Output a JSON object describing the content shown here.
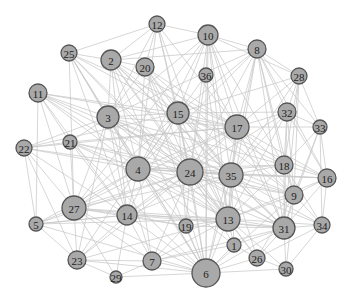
{
  "graph": {
    "title": "",
    "node_fill": "#a9a9a9",
    "node_stroke": "#555555",
    "edge_color": "#c8c8c8",
    "nodes": [
      {
        "id": "12",
        "x": 157,
        "y": 24,
        "size": 8
      },
      {
        "id": "25",
        "x": 69,
        "y": 53,
        "size": 8
      },
      {
        "id": "2",
        "x": 111,
        "y": 60,
        "size": 10
      },
      {
        "id": "20",
        "x": 145,
        "y": 67,
        "size": 9
      },
      {
        "id": "10",
        "x": 208,
        "y": 35,
        "size": 10
      },
      {
        "id": "8",
        "x": 257,
        "y": 49,
        "size": 9
      },
      {
        "id": "36",
        "x": 206,
        "y": 75,
        "size": 7
      },
      {
        "id": "28",
        "x": 299,
        "y": 76,
        "size": 8
      },
      {
        "id": "11",
        "x": 38,
        "y": 93,
        "size": 9
      },
      {
        "id": "3",
        "x": 108,
        "y": 117,
        "size": 11
      },
      {
        "id": "15",
        "x": 178,
        "y": 113,
        "size": 11
      },
      {
        "id": "17",
        "x": 237,
        "y": 127,
        "size": 12
      },
      {
        "id": "32",
        "x": 287,
        "y": 112,
        "size": 9
      },
      {
        "id": "33",
        "x": 320,
        "y": 127,
        "size": 7
      },
      {
        "id": "22",
        "x": 24,
        "y": 148,
        "size": 8
      },
      {
        "id": "21",
        "x": 70,
        "y": 142,
        "size": 7
      },
      {
        "id": "4",
        "x": 138,
        "y": 169,
        "size": 12
      },
      {
        "id": "24",
        "x": 190,
        "y": 172,
        "size": 13
      },
      {
        "id": "35",
        "x": 231,
        "y": 175,
        "size": 12
      },
      {
        "id": "18",
        "x": 284,
        "y": 165,
        "size": 9
      },
      {
        "id": "16",
        "x": 327,
        "y": 178,
        "size": 9
      },
      {
        "id": "9",
        "x": 294,
        "y": 195,
        "size": 9
      },
      {
        "id": "27",
        "x": 74,
        "y": 208,
        "size": 12
      },
      {
        "id": "14",
        "x": 127,
        "y": 215,
        "size": 10
      },
      {
        "id": "5",
        "x": 36,
        "y": 224,
        "size": 7
      },
      {
        "id": "13",
        "x": 228,
        "y": 219,
        "size": 12
      },
      {
        "id": "19",
        "x": 186,
        "y": 226,
        "size": 7
      },
      {
        "id": "31",
        "x": 284,
        "y": 228,
        "size": 11
      },
      {
        "id": "34",
        "x": 322,
        "y": 225,
        "size": 8
      },
      {
        "id": "1",
        "x": 234,
        "y": 245,
        "size": 7
      },
      {
        "id": "23",
        "x": 77,
        "y": 260,
        "size": 9
      },
      {
        "id": "7",
        "x": 152,
        "y": 261,
        "size": 9
      },
      {
        "id": "26",
        "x": 257,
        "y": 258,
        "size": 8
      },
      {
        "id": "29",
        "x": 116,
        "y": 277,
        "size": 6
      },
      {
        "id": "30",
        "x": 286,
        "y": 269,
        "size": 7
      },
      {
        "id": "6",
        "x": 206,
        "y": 273,
        "size": 14
      }
    ],
    "edges": [
      [
        "12",
        "2"
      ],
      [
        "12",
        "20"
      ],
      [
        "12",
        "15"
      ],
      [
        "12",
        "3"
      ],
      [
        "12",
        "17"
      ],
      [
        "12",
        "24"
      ],
      [
        "12",
        "4"
      ],
      [
        "12",
        "10"
      ],
      [
        "12",
        "25"
      ],
      [
        "12",
        "13"
      ],
      [
        "25",
        "2"
      ],
      [
        "25",
        "3"
      ],
      [
        "25",
        "15"
      ],
      [
        "25",
        "4"
      ],
      [
        "25",
        "24"
      ],
      [
        "25",
        "17"
      ],
      [
        "25",
        "27"
      ],
      [
        "25",
        "14"
      ],
      [
        "25",
        "13"
      ],
      [
        "25",
        "6"
      ],
      [
        "2",
        "20"
      ],
      [
        "2",
        "3"
      ],
      [
        "2",
        "15"
      ],
      [
        "2",
        "4"
      ],
      [
        "2",
        "24"
      ],
      [
        "2",
        "17"
      ],
      [
        "2",
        "35"
      ],
      [
        "2",
        "13"
      ],
      [
        "2",
        "6"
      ],
      [
        "2",
        "8"
      ],
      [
        "2",
        "10"
      ],
      [
        "2",
        "31"
      ],
      [
        "2",
        "14"
      ],
      [
        "20",
        "15"
      ],
      [
        "20",
        "3"
      ],
      [
        "20",
        "24"
      ],
      [
        "20",
        "4"
      ],
      [
        "20",
        "17"
      ],
      [
        "20",
        "13"
      ],
      [
        "20",
        "35"
      ],
      [
        "20",
        "6"
      ],
      [
        "20",
        "9"
      ],
      [
        "10",
        "8"
      ],
      [
        "10",
        "15"
      ],
      [
        "10",
        "17"
      ],
      [
        "10",
        "24"
      ],
      [
        "10",
        "3"
      ],
      [
        "10",
        "4"
      ],
      [
        "10",
        "35"
      ],
      [
        "10",
        "13"
      ],
      [
        "10",
        "31"
      ],
      [
        "10",
        "18"
      ],
      [
        "10",
        "28"
      ],
      [
        "10",
        "36"
      ],
      [
        "10",
        "6"
      ],
      [
        "10",
        "27"
      ],
      [
        "8",
        "28"
      ],
      [
        "8",
        "17"
      ],
      [
        "8",
        "15"
      ],
      [
        "8",
        "24"
      ],
      [
        "8",
        "35"
      ],
      [
        "8",
        "32"
      ],
      [
        "8",
        "3"
      ],
      [
        "8",
        "13"
      ],
      [
        "8",
        "31"
      ],
      [
        "8",
        "9"
      ],
      [
        "8",
        "4"
      ],
      [
        "8",
        "18"
      ],
      [
        "8",
        "16"
      ],
      [
        "8",
        "33"
      ],
      [
        "36",
        "24"
      ],
      [
        "36",
        "4"
      ],
      [
        "36",
        "13"
      ],
      [
        "36",
        "6"
      ],
      [
        "36",
        "17"
      ],
      [
        "28",
        "32"
      ],
      [
        "28",
        "17"
      ],
      [
        "28",
        "33"
      ],
      [
        "28",
        "31"
      ],
      [
        "28",
        "18"
      ],
      [
        "28",
        "35"
      ],
      [
        "28",
        "15"
      ],
      [
        "28",
        "9"
      ],
      [
        "11",
        "3"
      ],
      [
        "11",
        "15"
      ],
      [
        "11",
        "4"
      ],
      [
        "11",
        "24"
      ],
      [
        "11",
        "27"
      ],
      [
        "11",
        "17"
      ],
      [
        "11",
        "14"
      ],
      [
        "11",
        "21"
      ],
      [
        "11",
        "13"
      ],
      [
        "11",
        "5"
      ],
      [
        "11",
        "35"
      ],
      [
        "3",
        "15"
      ],
      [
        "3",
        "4"
      ],
      [
        "3",
        "24"
      ],
      [
        "3",
        "17"
      ],
      [
        "3",
        "35"
      ],
      [
        "3",
        "27"
      ],
      [
        "3",
        "14"
      ],
      [
        "3",
        "13"
      ],
      [
        "3",
        "6"
      ],
      [
        "3",
        "31"
      ],
      [
        "3",
        "9"
      ],
      [
        "3",
        "18"
      ],
      [
        "3",
        "21"
      ],
      [
        "3",
        "22"
      ],
      [
        "3",
        "23"
      ],
      [
        "3",
        "7"
      ],
      [
        "15",
        "17"
      ],
      [
        "15",
        "4"
      ],
      [
        "15",
        "24"
      ],
      [
        "15",
        "35"
      ],
      [
        "15",
        "13"
      ],
      [
        "15",
        "27"
      ],
      [
        "15",
        "14"
      ],
      [
        "15",
        "6"
      ],
      [
        "15",
        "31"
      ],
      [
        "15",
        "9"
      ],
      [
        "15",
        "18"
      ],
      [
        "15",
        "32"
      ],
      [
        "15",
        "22"
      ],
      [
        "15",
        "19"
      ],
      [
        "15",
        "16"
      ],
      [
        "17",
        "24"
      ],
      [
        "17",
        "35"
      ],
      [
        "17",
        "13"
      ],
      [
        "17",
        "4"
      ],
      [
        "17",
        "32"
      ],
      [
        "17",
        "18"
      ],
      [
        "17",
        "9"
      ],
      [
        "17",
        "31"
      ],
      [
        "17",
        "27"
      ],
      [
        "17",
        "14"
      ],
      [
        "17",
        "6"
      ],
      [
        "17",
        "33"
      ],
      [
        "17",
        "16"
      ],
      [
        "17",
        "21"
      ],
      [
        "17",
        "22"
      ],
      [
        "32",
        "18"
      ],
      [
        "32",
        "9"
      ],
      [
        "32",
        "31"
      ],
      [
        "32",
        "35"
      ],
      [
        "32",
        "24"
      ],
      [
        "32",
        "33"
      ],
      [
        "32",
        "16"
      ],
      [
        "32",
        "13"
      ],
      [
        "33",
        "16"
      ],
      [
        "33",
        "31"
      ],
      [
        "33",
        "9"
      ],
      [
        "33",
        "34"
      ],
      [
        "33",
        "18"
      ],
      [
        "22",
        "21"
      ],
      [
        "22",
        "27"
      ],
      [
        "22",
        "4"
      ],
      [
        "22",
        "24"
      ],
      [
        "22",
        "5"
      ],
      [
        "22",
        "14"
      ],
      [
        "22",
        "23"
      ],
      [
        "21",
        "4"
      ],
      [
        "21",
        "24"
      ],
      [
        "21",
        "27"
      ],
      [
        "21",
        "14"
      ],
      [
        "21",
        "35"
      ],
      [
        "21",
        "13"
      ],
      [
        "21",
        "6"
      ],
      [
        "4",
        "24"
      ],
      [
        "4",
        "35"
      ],
      [
        "4",
        "13"
      ],
      [
        "4",
        "27"
      ],
      [
        "4",
        "14"
      ],
      [
        "4",
        "6"
      ],
      [
        "4",
        "31"
      ],
      [
        "4",
        "9"
      ],
      [
        "4",
        "18"
      ],
      [
        "4",
        "7"
      ],
      [
        "4",
        "23"
      ],
      [
        "4",
        "19"
      ],
      [
        "4",
        "1"
      ],
      [
        "4",
        "5"
      ],
      [
        "4",
        "16"
      ],
      [
        "24",
        "35"
      ],
      [
        "24",
        "13"
      ],
      [
        "24",
        "27"
      ],
      [
        "24",
        "14"
      ],
      [
        "24",
        "6"
      ],
      [
        "24",
        "31"
      ],
      [
        "24",
        "9"
      ],
      [
        "24",
        "18"
      ],
      [
        "24",
        "16"
      ],
      [
        "24",
        "7"
      ],
      [
        "24",
        "23"
      ],
      [
        "24",
        "19"
      ],
      [
        "24",
        "1"
      ],
      [
        "24",
        "26"
      ],
      [
        "24",
        "34"
      ],
      [
        "24",
        "5"
      ],
      [
        "35",
        "13"
      ],
      [
        "35",
        "18"
      ],
      [
        "35",
        "9"
      ],
      [
        "35",
        "31"
      ],
      [
        "35",
        "16"
      ],
      [
        "35",
        "14"
      ],
      [
        "35",
        "27"
      ],
      [
        "35",
        "6"
      ],
      [
        "35",
        "26"
      ],
      [
        "35",
        "1"
      ],
      [
        "35",
        "34"
      ],
      [
        "18",
        "16"
      ],
      [
        "18",
        "9"
      ],
      [
        "18",
        "31"
      ],
      [
        "18",
        "34"
      ],
      [
        "18",
        "13"
      ],
      [
        "16",
        "34"
      ],
      [
        "16",
        "31"
      ],
      [
        "16",
        "9"
      ],
      [
        "16",
        "13"
      ],
      [
        "9",
        "31"
      ],
      [
        "9",
        "34"
      ],
      [
        "9",
        "13"
      ],
      [
        "9",
        "6"
      ],
      [
        "9",
        "30"
      ],
      [
        "9",
        "26"
      ],
      [
        "27",
        "14"
      ],
      [
        "27",
        "5"
      ],
      [
        "27",
        "23"
      ],
      [
        "27",
        "13"
      ],
      [
        "27",
        "6"
      ],
      [
        "27",
        "7"
      ],
      [
        "27",
        "29"
      ],
      [
        "27",
        "31"
      ],
      [
        "27",
        "19"
      ],
      [
        "14",
        "13"
      ],
      [
        "14",
        "6"
      ],
      [
        "14",
        "7"
      ],
      [
        "14",
        "23"
      ],
      [
        "14",
        "29"
      ],
      [
        "14",
        "31"
      ],
      [
        "14",
        "19"
      ],
      [
        "14",
        "5"
      ],
      [
        "5",
        "23"
      ],
      [
        "5",
        "13"
      ],
      [
        "5",
        "6"
      ],
      [
        "5",
        "14"
      ],
      [
        "13",
        "31"
      ],
      [
        "13",
        "6"
      ],
      [
        "13",
        "1"
      ],
      [
        "13",
        "26"
      ],
      [
        "13",
        "19"
      ],
      [
        "13",
        "7"
      ],
      [
        "13",
        "34"
      ],
      [
        "13",
        "30"
      ],
      [
        "13",
        "23"
      ],
      [
        "19",
        "6"
      ],
      [
        "19",
        "7"
      ],
      [
        "19",
        "31"
      ],
      [
        "31",
        "34"
      ],
      [
        "31",
        "30"
      ],
      [
        "31",
        "26"
      ],
      [
        "31",
        "6"
      ],
      [
        "31",
        "1"
      ],
      [
        "34",
        "30"
      ],
      [
        "34",
        "26"
      ],
      [
        "1",
        "6"
      ],
      [
        "1",
        "26"
      ],
      [
        "1",
        "7"
      ],
      [
        "23",
        "7"
      ],
      [
        "23",
        "29"
      ],
      [
        "23",
        "6"
      ],
      [
        "7",
        "29"
      ],
      [
        "7",
        "6"
      ],
      [
        "7",
        "31"
      ],
      [
        "26",
        "30"
      ],
      [
        "26",
        "6"
      ],
      [
        "29",
        "6"
      ],
      [
        "30",
        "6"
      ]
    ]
  }
}
